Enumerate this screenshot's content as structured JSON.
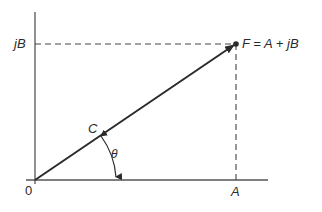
{
  "diagram": {
    "type": "phasor-diagram",
    "labels": {
      "origin": "0",
      "imag_axis_value": "jB",
      "real_axis_value": "A",
      "point": "F = A + jB",
      "vector_midpoint": "C",
      "angle": "θ"
    },
    "colors": {
      "line": "#2a2a2a",
      "axis": "#555555",
      "dashed": "#444444"
    }
  }
}
